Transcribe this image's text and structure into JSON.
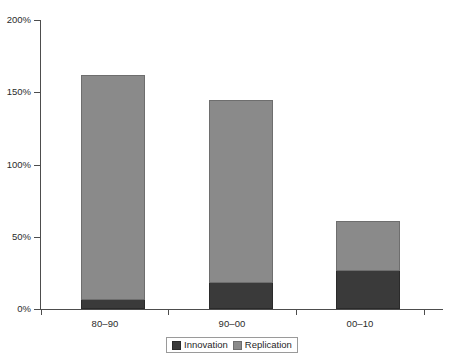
{
  "chart_data": {
    "type": "bar",
    "subtype": "stacked-bar",
    "title": "",
    "subtitle": "",
    "xlabel": "",
    "ylabel": "",
    "categories": [
      "80–90",
      "90–00",
      "00–10"
    ],
    "series": [
      {
        "name": "Innovation",
        "color": "#3a3a3a",
        "values": [
          6,
          18,
          26
        ]
      },
      {
        "name": "Replication",
        "color": "#8a8a8a",
        "values": [
          156,
          127,
          35
        ]
      }
    ],
    "totals": [
      162,
      145,
      61
    ],
    "ylim": [
      0,
      200
    ],
    "ytick_values": [
      0,
      50,
      100,
      150,
      200
    ],
    "ytick_labels": [
      "0%",
      "50%",
      "100%",
      "150%",
      "200%"
    ],
    "value_format": "percent",
    "grid": false,
    "legend_position": "bottom",
    "legend_entries": [
      "Innovation",
      "Replication"
    ]
  },
  "axes": {
    "y": {
      "ticks": [
        {
          "label": "200%",
          "value": 200
        },
        {
          "label": "150%",
          "value": 150
        },
        {
          "label": "100%",
          "value": 100
        },
        {
          "label": "50%",
          "value": 50
        },
        {
          "label": "0%",
          "value": 0
        }
      ]
    },
    "x": {
      "ticks": [
        {
          "label": "80–90"
        },
        {
          "label": "90–00"
        },
        {
          "label": "00–10"
        }
      ]
    }
  },
  "legend": {
    "items": [
      {
        "label": "Innovation",
        "color": "#3a3a3a"
      },
      {
        "label": "Replication",
        "color": "#8a8a8a"
      }
    ]
  },
  "colors": {
    "innovation": "#3a3a3a",
    "replication": "#8a8a8a",
    "axis": "#4d4d4d",
    "background": "#ffffff"
  }
}
